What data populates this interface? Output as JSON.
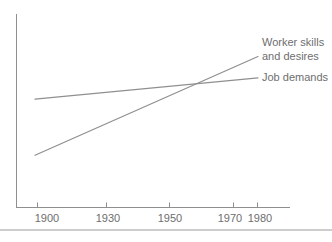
{
  "figure": {
    "background": "#ffffff",
    "divider_color": "#cdcdcd"
  },
  "chart_data": {
    "type": "line",
    "title": "",
    "xlabel": "",
    "ylabel": "",
    "x_ticks": [
      "1900",
      "1930",
      "1950",
      "1970",
      "1980"
    ],
    "x_tick_years": [
      1900,
      1930,
      1950,
      1970,
      1980
    ],
    "x_range": [
      1892,
      1992
    ],
    "ylim": [
      0,
      100
    ],
    "y_axis_labeled": false,
    "grid": false,
    "legend_position": "right-of-line-ends",
    "axis_color": "#8f8f8f",
    "line_color": "#8f8f8f",
    "text_color": "#6e6e6e",
    "series": [
      {
        "name": "Worker skills and desires",
        "label_lines": [
          "Worker skills",
          "and desires"
        ],
        "x": [
          1900,
          1980
        ],
        "values": [
          27,
          78
        ]
      },
      {
        "name": "Job demands",
        "label_lines": [
          "Job demands"
        ],
        "x": [
          1900,
          1980
        ],
        "values": [
          56,
          67
        ]
      }
    ]
  }
}
